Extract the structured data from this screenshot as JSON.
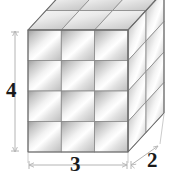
{
  "figure": {
    "shape_type": "rectangular prism composed of unit cubes",
    "dimensions": {
      "width_label": "3",
      "depth_label": "2",
      "height_label": "4"
    },
    "grid": {
      "front_columns": 3,
      "front_rows": 4,
      "side_columns": 2,
      "side_rows": 4,
      "top_columns": 3,
      "top_rows": 2
    },
    "colors": {
      "outline": "#6e6e6e",
      "cell_edge": "#8a8a8a",
      "fill_light": "#ffffff",
      "fill_mid": "#d9d9d9",
      "fill_dark": "#a8a8a8",
      "top_face": "#e8e8e8",
      "dimension_line": "#b0b0b0",
      "label_text": "#1a1a1a",
      "background": "#ffffff"
    }
  },
  "dimension_lines": {
    "height": {
      "orientation": "vertical",
      "value": "4",
      "tick_style": "arrow-tick"
    },
    "width": {
      "orientation": "horizontal",
      "value": "3",
      "tick_style": "arrow-tick"
    },
    "depth": {
      "orientation": "diagonal",
      "value": "2",
      "tick_style": "arrow-tick"
    }
  }
}
